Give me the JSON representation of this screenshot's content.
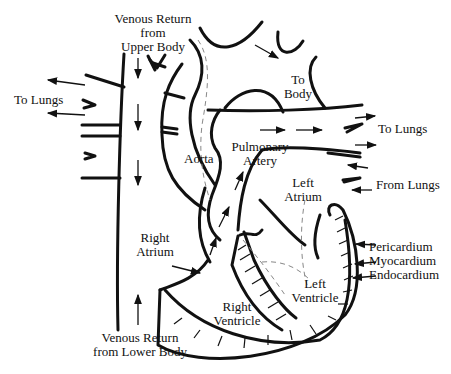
{
  "diagram": {
    "labels": {
      "venous_upper": [
        "Venous Return",
        "from",
        "Upper Body"
      ],
      "to_lungs_left": "To Lungs",
      "to_body": [
        "To",
        "Body"
      ],
      "to_lungs_right": "To Lungs",
      "aorta": "Aorta",
      "pulmonary_artery": [
        "Pulmonary",
        "Artery"
      ],
      "left_atrium": [
        "Left",
        "Atrium"
      ],
      "from_lungs": "From Lungs",
      "right_atrium": [
        "Right",
        "Atrium"
      ],
      "pericardium": "Pericardium",
      "myocardium": "Myocardium",
      "endocardium": "Endocardium",
      "left_ventricle": [
        "Left",
        "Ventricle"
      ],
      "right_ventricle": [
        "Right",
        "Ventricle"
      ],
      "venous_lower": [
        "Venous Return",
        "from Lower Body"
      ]
    },
    "colors": {
      "line": "#111111",
      "dashed": "#888888",
      "background": "#ffffff"
    }
  }
}
